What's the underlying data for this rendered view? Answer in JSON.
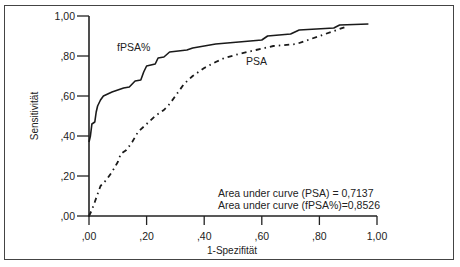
{
  "chart_data": {
    "type": "line",
    "title": "",
    "xlabel": "1-Spezifität",
    "ylabel": "Sensitivität",
    "xlim": [
      0,
      1
    ],
    "ylim": [
      0,
      1
    ],
    "grid": false,
    "x_ticks": [
      ",00",
      ",20",
      ",40",
      ",60",
      ",80",
      "1,00"
    ],
    "y_ticks": [
      ",00",
      ",20",
      ",40",
      ",60",
      ",80",
      "1,00"
    ],
    "series": [
      {
        "name": "fPSA%",
        "style": "solid",
        "label_position": [
          0.13,
          0.86
        ],
        "points": [
          [
            0,
            0.37
          ],
          [
            0.005,
            0.4
          ],
          [
            0.01,
            0.46
          ],
          [
            0.02,
            0.47
          ],
          [
            0.025,
            0.52
          ],
          [
            0.03,
            0.55
          ],
          [
            0.04,
            0.58
          ],
          [
            0.05,
            0.6
          ],
          [
            0.08,
            0.62
          ],
          [
            0.12,
            0.64
          ],
          [
            0.14,
            0.645
          ],
          [
            0.15,
            0.66
          ],
          [
            0.16,
            0.675
          ],
          [
            0.18,
            0.68
          ],
          [
            0.19,
            0.72
          ],
          [
            0.2,
            0.75
          ],
          [
            0.23,
            0.76
          ],
          [
            0.24,
            0.79
          ],
          [
            0.26,
            0.795
          ],
          [
            0.28,
            0.82
          ],
          [
            0.34,
            0.83
          ],
          [
            0.36,
            0.84
          ],
          [
            0.4,
            0.85
          ],
          [
            0.44,
            0.86
          ],
          [
            0.52,
            0.87
          ],
          [
            0.56,
            0.875
          ],
          [
            0.6,
            0.88
          ],
          [
            0.62,
            0.9
          ],
          [
            0.7,
            0.91
          ],
          [
            0.73,
            0.93
          ],
          [
            0.85,
            0.94
          ],
          [
            0.87,
            0.955
          ],
          [
            0.97,
            0.96
          ]
        ]
      },
      {
        "name": "PSA",
        "style": "dash-dot",
        "label_position": [
          0.65,
          0.76
        ],
        "points": [
          [
            0,
            0.0
          ],
          [
            0.01,
            0.03
          ],
          [
            0.02,
            0.07
          ],
          [
            0.03,
            0.11
          ],
          [
            0.04,
            0.15
          ],
          [
            0.06,
            0.18
          ],
          [
            0.08,
            0.22
          ],
          [
            0.1,
            0.27
          ],
          [
            0.11,
            0.31
          ],
          [
            0.13,
            0.33
          ],
          [
            0.15,
            0.37
          ],
          [
            0.17,
            0.42
          ],
          [
            0.2,
            0.46
          ],
          [
            0.23,
            0.5
          ],
          [
            0.26,
            0.53
          ],
          [
            0.28,
            0.56
          ],
          [
            0.3,
            0.6
          ],
          [
            0.33,
            0.66
          ],
          [
            0.36,
            0.7
          ],
          [
            0.4,
            0.74
          ],
          [
            0.44,
            0.77
          ],
          [
            0.47,
            0.79
          ],
          [
            0.52,
            0.81
          ],
          [
            0.58,
            0.83
          ],
          [
            0.64,
            0.85
          ],
          [
            0.72,
            0.86
          ],
          [
            0.76,
            0.88
          ],
          [
            0.82,
            0.91
          ],
          [
            0.86,
            0.93
          ],
          [
            0.9,
            0.95
          ]
        ]
      }
    ],
    "annotations": [
      "Area under curve (PSA) = 0,7137",
      "Area under curve (fPSA%)=0,8526"
    ],
    "auc": {
      "PSA": 0.7137,
      "fPSA%": 0.8526
    }
  },
  "labels": {
    "series_fpsa": "fPSA%",
    "series_psa": "PSA",
    "xlabel": "1-Spezifität",
    "ylabel": "Sensitivität",
    "annot_psa": "Area under curve (PSA) = 0,7137",
    "annot_fpsa": "Area under curve (fPSA%)=0,8526"
  }
}
